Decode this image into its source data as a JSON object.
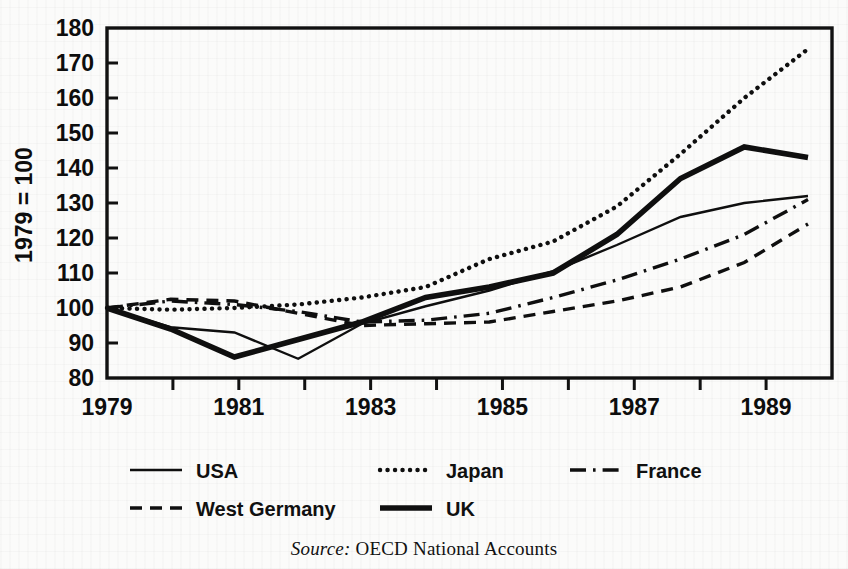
{
  "figure": {
    "y_axis_title": "1979 = 100",
    "source_keyword": "Source:",
    "source_text": "OECD National Accounts"
  },
  "legend": {
    "items": [
      {
        "label": "USA",
        "style": "solid-thin",
        "name": "legend-item-usa"
      },
      {
        "label": "Japan",
        "style": "dotted",
        "name": "legend-item-japan"
      },
      {
        "label": "France",
        "style": "dash-dot",
        "name": "legend-item-france"
      },
      {
        "label": "West Germany",
        "style": "dashed",
        "name": "legend-item-west-germany"
      },
      {
        "label": "UK",
        "style": "solid-thick",
        "name": "legend-item-uk"
      }
    ]
  },
  "chart_data": {
    "type": "line",
    "title": "",
    "xlabel": "",
    "ylabel": "1979 = 100",
    "xlim": [
      1979,
      1990
    ],
    "ylim": [
      80,
      180
    ],
    "grid": false,
    "legend_position": "below-axes",
    "x_tick_labels": [
      "1979",
      "1981",
      "1983",
      "1985",
      "1987",
      "1989"
    ],
    "x_ticks_major": [
      1979,
      1981,
      1983,
      1985,
      1987,
      1989
    ],
    "x_ticks_all": [
      1979,
      1980,
      1981,
      1982,
      1983,
      1984,
      1985,
      1986,
      1987,
      1988,
      1989,
      1990
    ],
    "y_tick_labels": [
      "80",
      "90",
      "100",
      "110",
      "120",
      "130",
      "140",
      "150",
      "160",
      "170",
      "180"
    ],
    "y_ticks": [
      80,
      90,
      100,
      110,
      120,
      130,
      140,
      150,
      160,
      170,
      180
    ],
    "x": [
      1979,
      1980,
      1981,
      1982,
      1983,
      1984,
      1985,
      1986,
      1987,
      1988,
      1989,
      1990
    ],
    "series": [
      {
        "name": "USA",
        "style": "solid-thin",
        "values": [
          100,
          94.5,
          93,
          85.5,
          95.5,
          100.5,
          105,
          110.5,
          118,
          126,
          130,
          132
        ]
      },
      {
        "name": "Japan",
        "style": "dotted",
        "values": [
          100,
          99.5,
          100,
          101,
          103,
          106,
          114,
          119,
          129,
          144,
          160,
          174
        ]
      },
      {
        "name": "France",
        "style": "dash-dot",
        "values": [
          100,
          102,
          101,
          99,
          96,
          96.5,
          98.5,
          103,
          108,
          114,
          121,
          131
        ]
      },
      {
        "name": "West Germany",
        "style": "dashed",
        "values": [
          100,
          102.5,
          102,
          98.5,
          95,
          95.5,
          96,
          99,
          102,
          106,
          113,
          124
        ]
      },
      {
        "name": "UK",
        "style": "solid-thick",
        "values": [
          100,
          94,
          86,
          91,
          96,
          103,
          106,
          110,
          121,
          137,
          146,
          143
        ]
      }
    ]
  }
}
